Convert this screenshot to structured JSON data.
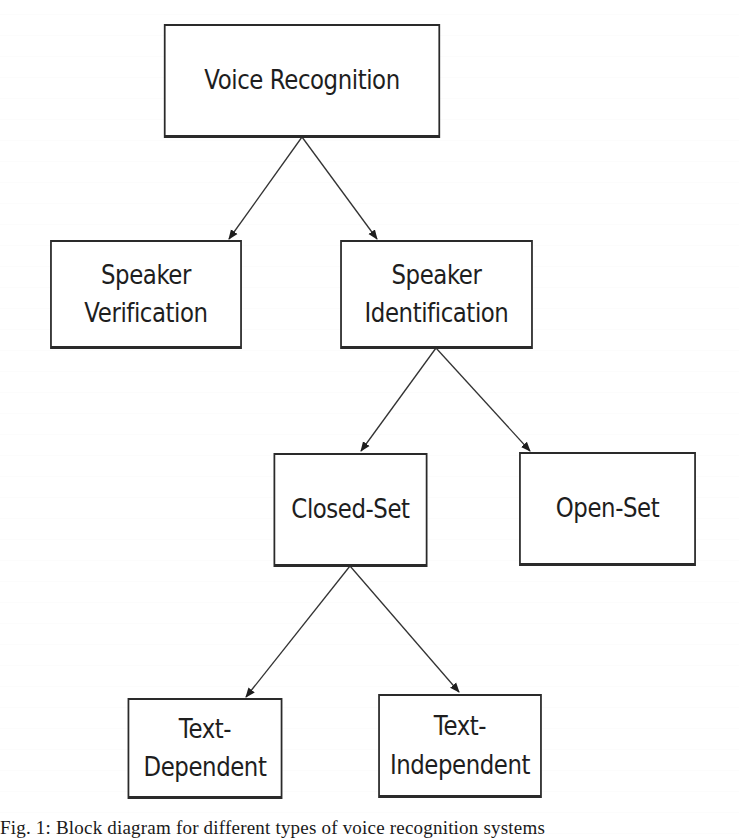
{
  "diagram": {
    "type": "hierarchy-block-diagram",
    "nodes": {
      "voice_recognition": {
        "label": "Voice Recognition"
      },
      "speaker_verification": {
        "label": "Speaker\nVerification"
      },
      "speaker_identification": {
        "label": "Speaker\nIdentification"
      },
      "closed_set": {
        "label": "Closed-Set"
      },
      "open_set": {
        "label": "Open-Set"
      },
      "text_dependent": {
        "label": "Text-\nDependent"
      },
      "text_independent": {
        "label": "Text-\nIndependent"
      }
    },
    "edges": [
      {
        "from": "voice_recognition",
        "to": "speaker_verification"
      },
      {
        "from": "voice_recognition",
        "to": "speaker_identification"
      },
      {
        "from": "speaker_identification",
        "to": "closed_set"
      },
      {
        "from": "speaker_identification",
        "to": "open_set"
      },
      {
        "from": "closed_set",
        "to": "text_dependent"
      },
      {
        "from": "closed_set",
        "to": "text_independent"
      }
    ],
    "colors": {
      "stroke": "#2a2a2a",
      "text": "#1e1e1e",
      "background": "#ffffff"
    }
  },
  "caption": {
    "text": "Fig. 1: Block diagram for different types of voice recognition systems"
  }
}
